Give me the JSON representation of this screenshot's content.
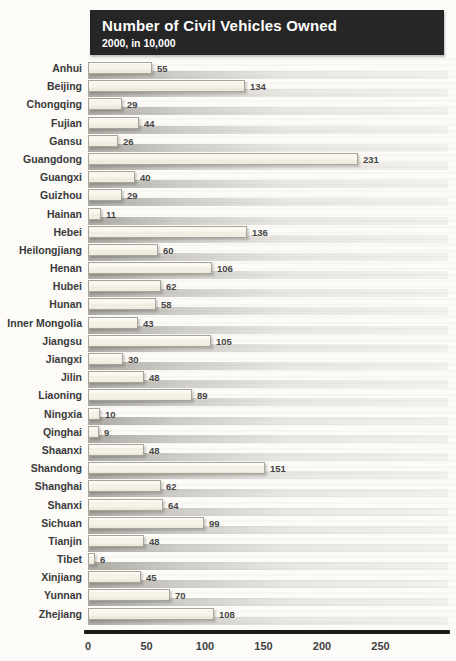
{
  "chart_data": {
    "type": "bar",
    "orientation": "horizontal",
    "title": "Number of Civil Vehicles Owned",
    "subtitle": "2000, in 10,000",
    "categories": [
      "Anhui",
      "Beijing",
      "Chongqing",
      "Fujian",
      "Gansu",
      "Guangdong",
      "Guangxi",
      "Guizhou",
      "Hainan",
      "Hebei",
      "Heilongjiang",
      "Henan",
      "Hubei",
      "Hunan",
      "Inner Mongolia",
      "Jiangsu",
      "Jiangxi",
      "Jilin",
      "Liaoning",
      "Ningxia",
      "Qinghai",
      "Shaanxi",
      "Shandong",
      "Shanghai",
      "Shanxi",
      "Sichuan",
      "Tianjin",
      "Tibet",
      "Xinjiang",
      "Yunnan",
      "Zhejiang"
    ],
    "values": [
      55,
      134,
      29,
      44,
      26,
      231,
      40,
      29,
      11,
      136,
      60,
      106,
      62,
      58,
      43,
      105,
      30,
      48,
      89,
      10,
      9,
      48,
      151,
      62,
      64,
      99,
      48,
      6,
      45,
      70,
      108
    ],
    "value_labels_shown": true,
    "xticks": [
      0,
      50,
      100,
      150,
      200,
      250
    ],
    "xlim": [
      0,
      300
    ],
    "xlabel": "",
    "ylabel": "",
    "legend": "none",
    "grid": "off",
    "colors": {
      "title_band_bg": "#262626",
      "title_text": "#ffffff",
      "bar_fill": "#f6f3e8",
      "bar_border": "#a8a59a",
      "bar_track_shadow": "#acaaa4",
      "label_text": "#3a3a3a",
      "axis_line": "#1a1a1a"
    }
  }
}
